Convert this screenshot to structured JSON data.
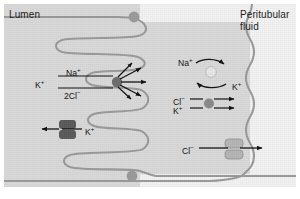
{
  "figure": {
    "type": "diagram",
    "background_color": "#d9d9d9",
    "cell_interior_color": "#f2f2f2",
    "membrane_color": "#9a9a9a",
    "border_color": "#ffffff"
  },
  "regions": {
    "lumen": {
      "label": "Lumen"
    },
    "peritubular": {
      "label_line1": "Peritubular",
      "label_line2": "fluid"
    }
  },
  "apical": {
    "nkcc": {
      "name": "NKCC cotransporter",
      "ions_in": [
        "Na",
        "K",
        "2Cl"
      ],
      "label_na": "Na",
      "label_na_charge": "+",
      "label_k": "K",
      "label_k_charge": "+",
      "label_cl": "2Cl",
      "label_cl_charge": "−",
      "marker_color": "#6e6e6e"
    },
    "k_channel": {
      "name": "K channel",
      "label_k": "K",
      "label_k_charge": "+",
      "marker_color": "#5a5a5a"
    }
  },
  "basolateral": {
    "na_k_pump": {
      "name": "Na/K ATPase pump",
      "label_na": "Na",
      "label_na_charge": "+",
      "label_k": "K",
      "label_k_charge": "+",
      "marker_color": "#e2e2e2"
    },
    "k_cl_cotransporter": {
      "name": "K-Cl cotransporter",
      "label_cl": "Cl",
      "label_cl_charge": "−",
      "label_k": "K",
      "label_k_charge": "+",
      "marker_color": "#8a8a8a"
    },
    "cl_channel": {
      "name": "Cl channel",
      "label_cl": "Cl",
      "label_cl_charge": "−",
      "marker_color": "#b5b5b5"
    }
  },
  "junctions": {
    "top": {
      "name": "tight-junction-top"
    },
    "bottom": {
      "name": "tight-junction-bottom"
    }
  }
}
